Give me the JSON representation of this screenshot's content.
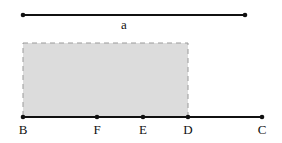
{
  "diagram": {
    "segment_a": {
      "label": "a",
      "x1": 23,
      "x2": 245,
      "y": 15,
      "label_x": 124,
      "label_y": 18
    },
    "rectangle": {
      "x": 23,
      "y": 43,
      "width": 165,
      "height": 74,
      "fill": "#dcdcdc",
      "stroke": "#9a9a9a"
    },
    "baseline": {
      "x1": 23,
      "x2": 262,
      "y": 117
    },
    "points": [
      {
        "label": "B",
        "x": 23
      },
      {
        "label": "F",
        "x": 97
      },
      {
        "label": "E",
        "x": 143
      },
      {
        "label": "D",
        "x": 188
      },
      {
        "label": "C",
        "x": 262
      }
    ],
    "point_label_y": 123,
    "line_color": "#111111"
  }
}
